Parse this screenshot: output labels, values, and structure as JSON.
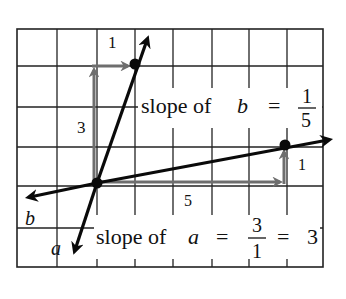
{
  "diagram": {
    "lines": {
      "a": {
        "name": "a",
        "slope_label_prefix": "slope of ",
        "variable": "a",
        "equals": "=",
        "numerator": "3",
        "denominator": "1",
        "result_equals": "=",
        "result": "3",
        "rise": "3",
        "run": "1"
      },
      "b": {
        "name": "b",
        "slope_label_prefix": "slope of ",
        "variable": "b",
        "equals": "=",
        "numerator": "1",
        "denominator": "5",
        "rise": "1",
        "run": "5"
      }
    },
    "step_labels": {
      "a_rise": "3",
      "a_run": "1",
      "b_run": "5",
      "b_rise": "1"
    },
    "line_labels": {
      "a": "a",
      "b": "b"
    },
    "colors": {
      "lines": "#0a0a0a",
      "step_arrows": "#6e6e6e",
      "grid": "#222222",
      "background": "#ffffff"
    }
  }
}
